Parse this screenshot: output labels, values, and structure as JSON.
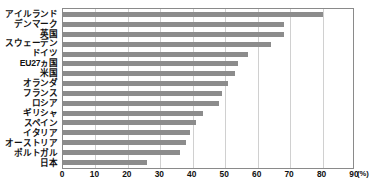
{
  "chart_data": {
    "type": "bar",
    "orientation": "horizontal",
    "title": "",
    "subtitle": "",
    "xlabel": "",
    "ylabel": "",
    "unit_label": "(%)",
    "xlim": [
      0,
      90
    ],
    "xticks": [
      0,
      10,
      20,
      30,
      40,
      50,
      60,
      70,
      80,
      90
    ],
    "xtick_labels": [
      "0",
      "10",
      "20",
      "30",
      "40",
      "50",
      "60",
      "70",
      "80",
      "90"
    ],
    "grid": true,
    "legend": false,
    "bar_color": "#8c8c8c",
    "categories": [
      "アイルランド",
      "デンマーク",
      "英国",
      "スウェーデン",
      "ドイツ",
      "EU27ヵ国",
      "米国",
      "オランダ",
      "フランス",
      "ロシア",
      "ギリシャ",
      "スペイン",
      "イタリア",
      "オーストリア",
      "ポルトガル",
      "日本"
    ],
    "values": [
      80,
      68,
      68,
      64,
      57,
      54,
      53,
      51,
      49,
      48,
      43,
      41,
      39,
      38,
      36,
      26
    ]
  }
}
